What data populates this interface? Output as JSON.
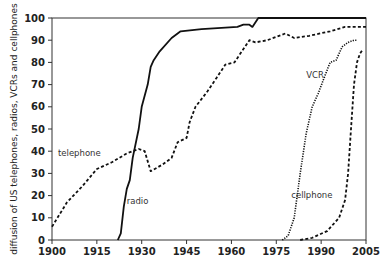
{
  "chart_data": {
    "type": "line",
    "title": "",
    "xlabel": "",
    "ylabel": "diffusion of US telephones, radios, VCRs and cellphones",
    "xlim": [
      1900,
      2005
    ],
    "ylim": [
      0,
      100
    ],
    "x_ticks": [
      1900,
      1915,
      1930,
      1945,
      1960,
      1975,
      1990,
      2005
    ],
    "y_ticks": [
      0,
      10,
      20,
      30,
      40,
      50,
      60,
      70,
      80,
      90,
      100
    ],
    "grid": false,
    "legend": "inline labels",
    "series": [
      {
        "name": "telephone",
        "style": "dashed",
        "label_pos": [
          1902,
          38
        ],
        "points": [
          [
            1900,
            6
          ],
          [
            1905,
            17
          ],
          [
            1910,
            24
          ],
          [
            1915,
            32
          ],
          [
            1920,
            35
          ],
          [
            1925,
            39
          ],
          [
            1929,
            41
          ],
          [
            1931,
            40
          ],
          [
            1933,
            31
          ],
          [
            1937,
            34
          ],
          [
            1940,
            37
          ],
          [
            1942,
            44
          ],
          [
            1945,
            46
          ],
          [
            1946,
            53
          ],
          [
            1948,
            60
          ],
          [
            1952,
            67
          ],
          [
            1955,
            73
          ],
          [
            1958,
            79
          ],
          [
            1961,
            80
          ],
          [
            1964,
            86
          ],
          [
            1966,
            90
          ],
          [
            1968,
            89
          ],
          [
            1972,
            90
          ],
          [
            1978,
            93
          ],
          [
            1981,
            91
          ],
          [
            1986,
            92
          ],
          [
            1993,
            94
          ],
          [
            1998,
            96
          ],
          [
            2005,
            96
          ]
        ]
      },
      {
        "name": "radio",
        "style": "solid",
        "label_pos": [
          1925,
          16
        ],
        "points": [
          [
            1922,
            0
          ],
          [
            1923,
            3
          ],
          [
            1924,
            15
          ],
          [
            1925,
            23
          ],
          [
            1926,
            27
          ],
          [
            1927,
            37
          ],
          [
            1929,
            50
          ],
          [
            1930,
            60
          ],
          [
            1932,
            70
          ],
          [
            1933,
            78
          ],
          [
            1934,
            81
          ],
          [
            1936,
            85
          ],
          [
            1940,
            91
          ],
          [
            1943,
            94
          ],
          [
            1950,
            95
          ],
          [
            1962,
            96
          ],
          [
            1964,
            97
          ],
          [
            1966,
            97
          ],
          [
            1967,
            96
          ],
          [
            1969,
            100
          ],
          [
            2005,
            100
          ]
        ]
      },
      {
        "name": "VCR",
        "style": "dotted",
        "label_pos": [
          1985,
          73
        ],
        "points": [
          [
            1977,
            0
          ],
          [
            1979,
            2
          ],
          [
            1981,
            10
          ],
          [
            1983,
            30
          ],
          [
            1985,
            48
          ],
          [
            1987,
            60
          ],
          [
            1989,
            66
          ],
          [
            1991,
            73
          ],
          [
            1993,
            80
          ],
          [
            1995,
            81
          ],
          [
            1997,
            87
          ],
          [
            1999,
            89
          ],
          [
            2001,
            90
          ],
          [
            2002,
            90
          ]
        ]
      },
      {
        "name": "cellphone",
        "style": "dashed",
        "label_pos": [
          1980,
          19
        ],
        "points": [
          [
            1983,
            0
          ],
          [
            1987,
            1
          ],
          [
            1992,
            4
          ],
          [
            1996,
            10
          ],
          [
            1998,
            18
          ],
          [
            1999,
            30
          ],
          [
            2000,
            50
          ],
          [
            2001,
            70
          ],
          [
            2002,
            80
          ],
          [
            2003,
            84
          ],
          [
            2004,
            86
          ]
        ]
      }
    ]
  },
  "colors": {
    "line": "#111111",
    "axis": "#333333",
    "text": "#222222",
    "background": "#ffffff"
  }
}
